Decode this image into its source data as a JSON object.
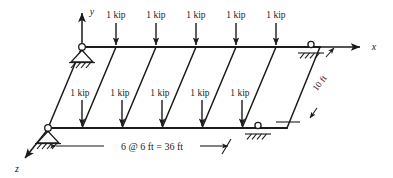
{
  "figure": {
    "type": "structural-frame-load-diagram",
    "line_color": "#1b1b1b",
    "background_color": "#ffffff"
  },
  "axes": [
    {
      "id": "y",
      "label": "y",
      "direction": "up"
    },
    {
      "id": "x",
      "label": "x",
      "direction": "right"
    },
    {
      "id": "z",
      "label": "z",
      "direction": "down-left"
    }
  ],
  "loads": {
    "value_label": "1 kip",
    "top_beam": [
      {
        "label": "1 kip"
      },
      {
        "label": "1 kip"
      },
      {
        "label": "1 kip"
      },
      {
        "label": "1 kip"
      },
      {
        "label": "1 kip"
      }
    ],
    "front_beam": [
      {
        "label": "1 kip"
      },
      {
        "label": "1 kip"
      },
      {
        "label": "1 kip"
      },
      {
        "label": "1 kip"
      },
      {
        "label": "1 kip"
      }
    ]
  },
  "dimensions": {
    "span": "6 @ 6 ft  =  36 ft",
    "depth": "10 ft"
  },
  "supports": [
    {
      "id": "top-left",
      "kind": "pin"
    },
    {
      "id": "top-right",
      "kind": "roller"
    },
    {
      "id": "front-left",
      "kind": "pin"
    },
    {
      "id": "front-right",
      "kind": "roller"
    }
  ]
}
